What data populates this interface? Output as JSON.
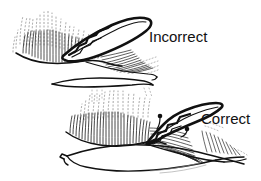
{
  "figure": {
    "style": "pen-and-ink line drawing",
    "background_color": "#ffffff",
    "ink_color": "#111111",
    "panels": [
      {
        "id": "top-panel",
        "label": "Incorrect",
        "description": "Upper drawing of baleen plates with dark lens-shaped implement angled upward across the baleen fringe"
      },
      {
        "id": "bottom-panel",
        "label": "Correct",
        "description": "Lower drawing of baleen plates with dark stepped implement lying flat along the baleen fringe, two marker dots shown"
      }
    ]
  },
  "labels": {
    "incorrect": "Incorrect",
    "correct": "Correct"
  },
  "colors": {
    "ink": "#111111",
    "hatch": "#2a2a2a",
    "faint": "#6a6a6a",
    "background": "#ffffff"
  }
}
